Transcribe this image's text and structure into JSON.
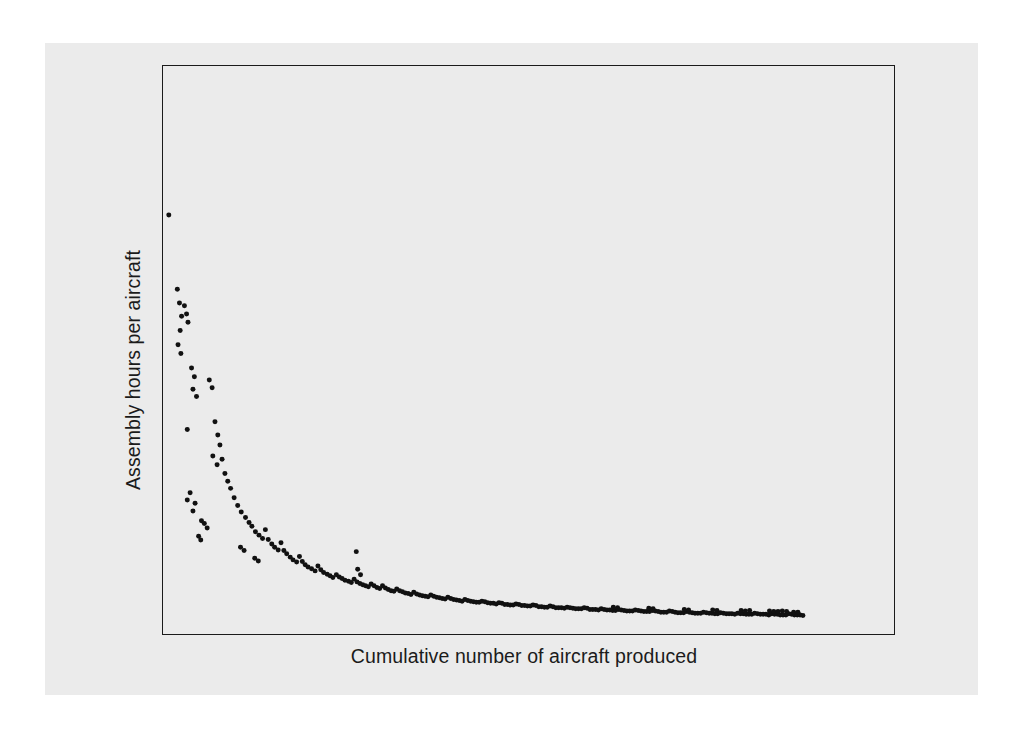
{
  "figure": {
    "background_color": "#ffffff",
    "page_color": "#ebebeb",
    "frame_color": "#1b1b1b",
    "marker_color": "#111111"
  },
  "axes": {
    "x_label": "Cumulative number of aircraft produced",
    "y_label": "Assembly hours per aircraft"
  },
  "chart_data": {
    "type": "scatter",
    "title": "",
    "subtitle": "",
    "xlabel": "Cumulative number of aircraft produced",
    "ylabel": "Assembly hours per aircraft",
    "xlim": [
      0,
      100
    ],
    "ylim": [
      0,
      100
    ],
    "grid": false,
    "legend": null,
    "annotations": [],
    "axis_ticks": {
      "x": [],
      "y": []
    },
    "marker_size_px": 5,
    "point_count": 247,
    "series": [
      {
        "name": "Assembly hours per aircraft",
        "color": "#111111",
        "points": [
          [
            0.4,
            74.0
          ],
          [
            1.6,
            60.5
          ],
          [
            1.9,
            58.0
          ],
          [
            2.2,
            55.6
          ],
          [
            2.0,
            53.0
          ],
          [
            2.6,
            57.5
          ],
          [
            2.9,
            56.0
          ],
          [
            3.1,
            54.5
          ],
          [
            1.7,
            50.4
          ],
          [
            2.1,
            48.8
          ],
          [
            3.6,
            46.2
          ],
          [
            4.0,
            44.6
          ],
          [
            3.8,
            42.3
          ],
          [
            4.3,
            41.0
          ],
          [
            6.1,
            44.0
          ],
          [
            6.5,
            42.6
          ],
          [
            3.0,
            35.0
          ],
          [
            6.9,
            36.4
          ],
          [
            7.3,
            34.0
          ],
          [
            7.6,
            32.2
          ],
          [
            6.6,
            30.2
          ],
          [
            7.9,
            29.6
          ],
          [
            7.2,
            28.6
          ],
          [
            8.3,
            27.0
          ],
          [
            8.7,
            25.6
          ],
          [
            9.1,
            24.3
          ],
          [
            3.4,
            23.5
          ],
          [
            3.0,
            22.2
          ],
          [
            4.1,
            21.6
          ],
          [
            3.8,
            20.2
          ],
          [
            9.6,
            22.6
          ],
          [
            10.1,
            21.2
          ],
          [
            10.6,
            20.0
          ],
          [
            5.0,
            18.4
          ],
          [
            5.4,
            17.9
          ],
          [
            5.8,
            17.1
          ],
          [
            11.2,
            19.0
          ],
          [
            11.7,
            18.1
          ],
          [
            12.1,
            17.4
          ],
          [
            4.6,
            15.6
          ],
          [
            4.9,
            14.9
          ],
          [
            12.6,
            16.4
          ],
          [
            13.1,
            15.8
          ],
          [
            13.6,
            15.2
          ],
          [
            14.0,
            16.8
          ],
          [
            14.4,
            15.0
          ],
          [
            10.5,
            13.6
          ],
          [
            11.0,
            13.0
          ],
          [
            14.9,
            14.2
          ],
          [
            15.3,
            13.6
          ],
          [
            15.8,
            13.1
          ],
          [
            16.2,
            14.4
          ],
          [
            16.6,
            13.0
          ],
          [
            17.0,
            12.4
          ],
          [
            12.5,
            11.6
          ],
          [
            13.0,
            11.1
          ],
          [
            17.5,
            11.8
          ],
          [
            17.9,
            11.3
          ],
          [
            18.4,
            10.9
          ],
          [
            18.8,
            11.9
          ],
          [
            19.2,
            11.0
          ],
          [
            19.6,
            10.4
          ],
          [
            20.0,
            10.0
          ],
          [
            20.5,
            9.7
          ],
          [
            21.0,
            9.3
          ],
          [
            21.4,
            10.2
          ],
          [
            21.8,
            9.5
          ],
          [
            22.2,
            9.0
          ],
          [
            22.7,
            8.7
          ],
          [
            23.1,
            8.4
          ],
          [
            23.5,
            8.1
          ],
          [
            24.0,
            8.6
          ],
          [
            24.4,
            8.2
          ],
          [
            24.8,
            7.9
          ],
          [
            25.2,
            7.6
          ],
          [
            25.7,
            7.4
          ],
          [
            26.1,
            7.2
          ],
          [
            26.5,
            7.8
          ],
          [
            26.9,
            7.3
          ],
          [
            27.3,
            7.0
          ],
          [
            27.7,
            6.8
          ],
          [
            28.1,
            6.6
          ],
          [
            28.5,
            6.4
          ],
          [
            26.8,
            12.8
          ],
          [
            27.0,
            9.6
          ],
          [
            27.4,
            8.6
          ],
          [
            28.9,
            6.9
          ],
          [
            29.3,
            6.6
          ],
          [
            29.7,
            6.3
          ],
          [
            30.1,
            6.1
          ],
          [
            30.5,
            6.6
          ],
          [
            30.9,
            6.2
          ],
          [
            31.3,
            5.9
          ],
          [
            31.7,
            5.7
          ],
          [
            32.1,
            5.6
          ],
          [
            32.5,
            6.0
          ],
          [
            32.9,
            5.7
          ],
          [
            33.3,
            5.5
          ],
          [
            33.7,
            5.3
          ],
          [
            34.1,
            5.2
          ],
          [
            34.5,
            5.0
          ],
          [
            34.9,
            5.4
          ],
          [
            35.3,
            5.1
          ],
          [
            35.7,
            4.9
          ],
          [
            36.1,
            4.8
          ],
          [
            36.5,
            4.7
          ],
          [
            36.9,
            4.6
          ],
          [
            37.3,
            4.9
          ],
          [
            37.7,
            4.7
          ],
          [
            38.1,
            4.5
          ],
          [
            38.5,
            4.4
          ],
          [
            38.9,
            4.3
          ],
          [
            39.3,
            4.2
          ],
          [
            39.7,
            4.5
          ],
          [
            40.1,
            4.3
          ],
          [
            40.5,
            4.1
          ],
          [
            40.9,
            4.0
          ],
          [
            41.3,
            3.9
          ],
          [
            41.7,
            3.8
          ],
          [
            42.1,
            4.1
          ],
          [
            42.5,
            3.9
          ],
          [
            42.9,
            3.8
          ],
          [
            43.3,
            3.7
          ],
          [
            43.7,
            3.6
          ],
          [
            44.1,
            3.6
          ],
          [
            44.5,
            3.8
          ],
          [
            44.9,
            3.7
          ],
          [
            45.3,
            3.5
          ],
          [
            45.7,
            3.4
          ],
          [
            46.1,
            3.4
          ],
          [
            46.5,
            3.3
          ],
          [
            46.9,
            3.5
          ],
          [
            47.3,
            3.4
          ],
          [
            47.7,
            3.2
          ],
          [
            48.1,
            3.2
          ],
          [
            48.5,
            3.1
          ],
          [
            48.9,
            3.1
          ],
          [
            49.3,
            3.3
          ],
          [
            49.7,
            3.2
          ],
          [
            50.1,
            3.0
          ],
          [
            50.5,
            3.0
          ],
          [
            50.9,
            2.9
          ],
          [
            51.3,
            2.9
          ],
          [
            51.7,
            3.1
          ],
          [
            52.1,
            3.0
          ],
          [
            52.5,
            2.8
          ],
          [
            52.9,
            2.8
          ],
          [
            53.3,
            2.7
          ],
          [
            53.7,
            2.7
          ],
          [
            54.1,
            2.9
          ],
          [
            54.5,
            2.8
          ],
          [
            54.9,
            2.6
          ],
          [
            55.3,
            2.6
          ],
          [
            55.7,
            2.6
          ],
          [
            56.1,
            2.5
          ],
          [
            56.5,
            2.7
          ],
          [
            56.9,
            2.6
          ],
          [
            57.3,
            2.5
          ],
          [
            57.7,
            2.4
          ],
          [
            58.1,
            2.4
          ],
          [
            58.5,
            2.4
          ],
          [
            58.9,
            2.6
          ],
          [
            59.3,
            2.5
          ],
          [
            59.7,
            2.3
          ],
          [
            60.1,
            2.3
          ],
          [
            60.5,
            2.3
          ],
          [
            60.9,
            2.2
          ],
          [
            61.3,
            2.4
          ],
          [
            61.7,
            2.3
          ],
          [
            62.1,
            2.2
          ],
          [
            62.5,
            2.2
          ],
          [
            62.9,
            2.1
          ],
          [
            63.3,
            2.1
          ],
          [
            63.7,
            2.3
          ],
          [
            64.1,
            2.2
          ],
          [
            64.5,
            2.1
          ],
          [
            64.9,
            2.0
          ],
          [
            65.3,
            2.0
          ],
          [
            65.7,
            2.0
          ],
          [
            66.1,
            2.2
          ],
          [
            66.5,
            2.1
          ],
          [
            66.9,
            2.0
          ],
          [
            67.3,
            1.9
          ],
          [
            67.7,
            1.9
          ],
          [
            68.1,
            1.9
          ],
          [
            68.5,
            2.1
          ],
          [
            68.9,
            2.0
          ],
          [
            69.3,
            1.9
          ],
          [
            69.7,
            1.8
          ],
          [
            70.1,
            1.8
          ],
          [
            70.5,
            1.8
          ],
          [
            70.9,
            2.0
          ],
          [
            71.3,
            1.9
          ],
          [
            71.7,
            1.8
          ],
          [
            72.1,
            1.7
          ],
          [
            72.5,
            1.7
          ],
          [
            72.9,
            1.7
          ],
          [
            73.3,
            1.9
          ],
          [
            73.7,
            1.8
          ],
          [
            74.1,
            1.7
          ],
          [
            74.5,
            1.6
          ],
          [
            74.9,
            1.6
          ],
          [
            75.3,
            1.6
          ],
          [
            75.7,
            1.8
          ],
          [
            76.1,
            1.7
          ],
          [
            76.5,
            1.6
          ],
          [
            76.9,
            1.6
          ],
          [
            77.3,
            1.5
          ],
          [
            77.7,
            1.5
          ],
          [
            78.1,
            1.7
          ],
          [
            78.5,
            1.6
          ],
          [
            78.9,
            1.5
          ],
          [
            79.3,
            1.5
          ],
          [
            79.7,
            1.5
          ],
          [
            80.1,
            1.4
          ],
          [
            80.5,
            1.6
          ],
          [
            80.9,
            1.5
          ],
          [
            81.3,
            1.5
          ],
          [
            81.7,
            1.4
          ],
          [
            82.1,
            1.4
          ],
          [
            82.5,
            1.4
          ],
          [
            82.9,
            1.6
          ],
          [
            83.3,
            1.5
          ],
          [
            83.7,
            1.4
          ],
          [
            84.1,
            1.4
          ],
          [
            84.5,
            1.4
          ],
          [
            84.9,
            1.3
          ],
          [
            85.3,
            1.5
          ],
          [
            85.7,
            1.4
          ],
          [
            86.1,
            1.4
          ],
          [
            86.5,
            1.3
          ],
          [
            86.9,
            1.3
          ],
          [
            87.3,
            1.3
          ],
          [
            87.7,
            1.5
          ],
          [
            88.1,
            1.4
          ],
          [
            88.5,
            1.3
          ],
          [
            88.9,
            1.3
          ],
          [
            89.3,
            1.3
          ],
          [
            89.7,
            1.2
          ],
          [
            85.0,
            2.0
          ],
          [
            85.6,
            1.9
          ],
          [
            86.2,
            1.9
          ],
          [
            86.8,
            2.0
          ],
          [
            87.4,
            1.9
          ],
          [
            88.4,
            1.8
          ],
          [
            89.0,
            1.8
          ],
          [
            81.0,
            2.1
          ],
          [
            81.6,
            2.0
          ],
          [
            82.2,
            2.1
          ],
          [
            77.0,
            2.2
          ],
          [
            77.6,
            2.1
          ],
          [
            73.0,
            2.3
          ],
          [
            73.6,
            2.2
          ],
          [
            68.0,
            2.5
          ],
          [
            68.6,
            2.4
          ],
          [
            63.0,
            2.7
          ],
          [
            63.6,
            2.6
          ]
        ]
      }
    ]
  }
}
